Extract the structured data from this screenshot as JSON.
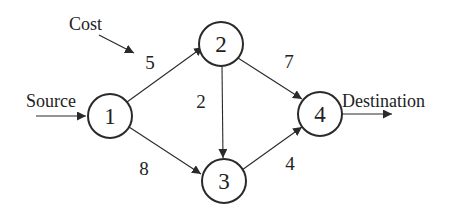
{
  "diagram": {
    "type": "directed-weighted-graph",
    "colors": {
      "stroke": "#2a2a2a",
      "text": "#222222",
      "background": "#ffffff"
    },
    "nodes": [
      {
        "id": "1",
        "label": "1",
        "cx": 110,
        "cy": 116,
        "r": 22
      },
      {
        "id": "2",
        "label": "2",
        "cx": 221,
        "cy": 44,
        "r": 22
      },
      {
        "id": "3",
        "label": "3",
        "cx": 224,
        "cy": 181,
        "r": 22
      },
      {
        "id": "4",
        "label": "4",
        "cx": 320,
        "cy": 114,
        "r": 22
      }
    ],
    "edges": [
      {
        "from": "1",
        "to": "2",
        "cost": "5"
      },
      {
        "from": "1",
        "to": "3",
        "cost": "8"
      },
      {
        "from": "2",
        "to": "3",
        "cost": "2"
      },
      {
        "from": "2",
        "to": "4",
        "cost": "7"
      },
      {
        "from": "3",
        "to": "4",
        "cost": "4"
      }
    ],
    "annotations": {
      "cost": "Cost",
      "source": "Source",
      "destination": "Destination"
    }
  }
}
